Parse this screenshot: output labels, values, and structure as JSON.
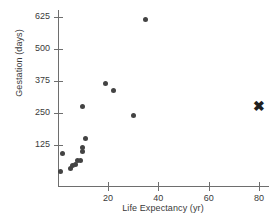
{
  "chart_data": {
    "type": "scatter",
    "title": "",
    "xlabel": "Life Expectancy (yr)",
    "ylabel": "Gestation (days)",
    "xlim": [
      0,
      84
    ],
    "ylim": [
      0,
      660
    ],
    "grid": false,
    "legend": "none",
    "xticks": [
      20,
      40,
      60,
      80
    ],
    "xticklabels": [
      "20",
      "40",
      "60",
      "80"
    ],
    "yticks": [
      125,
      250,
      375,
      500,
      625
    ],
    "yticklabels": [
      "125",
      "250",
      "375",
      "500",
      "625"
    ],
    "series": [
      {
        "name": "animals",
        "marker": "circle",
        "color": "#434343",
        "points": [
          {
            "x": 1.0,
            "y": 21
          },
          {
            "x": 2.0,
            "y": 92
          },
          {
            "x": 5.0,
            "y": 33
          },
          {
            "x": 6.0,
            "y": 44
          },
          {
            "x": 7.0,
            "y": 50
          },
          {
            "x": 8.0,
            "y": 63
          },
          {
            "x": 9.0,
            "y": 63
          },
          {
            "x": 10.0,
            "y": 100
          },
          {
            "x": 10.0,
            "y": 115
          },
          {
            "x": 11.0,
            "y": 151
          },
          {
            "x": 10.0,
            "y": 275
          },
          {
            "x": 19.0,
            "y": 366
          },
          {
            "x": 22.0,
            "y": 336
          },
          {
            "x": 30.0,
            "y": 241
          },
          {
            "x": 35.0,
            "y": 617
          }
        ]
      },
      {
        "name": "human",
        "marker": "x",
        "color": "#1f1f1f",
        "points": [
          {
            "x": 80.0,
            "y": 277
          }
        ]
      }
    ]
  },
  "markers": {
    "x_glyph": "✖"
  }
}
